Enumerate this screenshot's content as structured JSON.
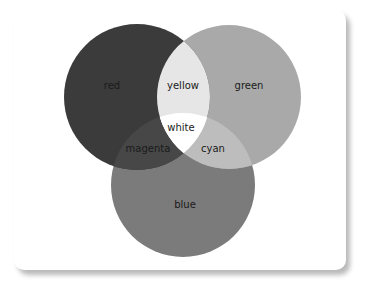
{
  "diagram": {
    "type": "venn",
    "circles": [
      {
        "name": "red",
        "label": "red",
        "cx": 137,
        "cy": 97,
        "r": 73,
        "color": "#3b3b3b"
      },
      {
        "name": "green",
        "label": "green",
        "cx": 229,
        "cy": 97,
        "r": 72,
        "color": "#a9a9a9"
      },
      {
        "name": "blue",
        "label": "blue",
        "cx": 183,
        "cy": 185,
        "r": 72,
        "color": "#7b7b7b"
      }
    ],
    "overlaps": [
      {
        "name": "yellow",
        "label": "yellow",
        "sets": [
          "red",
          "green"
        ],
        "color": "#e6e6e6"
      },
      {
        "name": "magenta",
        "label": "magenta",
        "sets": [
          "red",
          "blue"
        ],
        "color": "#474747"
      },
      {
        "name": "cyan",
        "label": "cyan",
        "sets": [
          "green",
          "blue"
        ],
        "color": "#bdbdbd"
      },
      {
        "name": "white",
        "label": "white",
        "sets": [
          "red",
          "green",
          "blue"
        ],
        "color": "#ffffff"
      }
    ]
  }
}
